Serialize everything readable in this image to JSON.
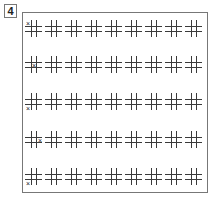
{
  "puzzle": {
    "number": "4",
    "rows": 5,
    "columns": 9,
    "mark_symbol": "×",
    "rows_data": [
      {
        "mark_cell": "top-left"
      },
      {
        "mark_cell": "center"
      },
      {
        "mark_cell": "bottom-left"
      },
      {
        "mark_cell": "middle-right"
      },
      {
        "mark_cell": "bottom-left"
      }
    ]
  }
}
